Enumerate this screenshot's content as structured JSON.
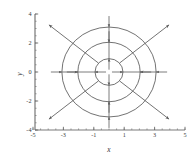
{
  "figure": {
    "title": "",
    "background_color": "#ffffff",
    "line_color": "#5a5a5a",
    "axis_color": "#6b6b6b",
    "text_color": "#3a3a3a"
  },
  "axes": {
    "x_label": "x",
    "y_label": "y",
    "x_ticks": [
      "-5",
      "-3",
      "-1",
      "1",
      "3",
      "5"
    ],
    "x_tick_values": [
      -5,
      -3,
      -1,
      1,
      3,
      5
    ],
    "y_ticks": [
      "-4",
      "-2",
      "0",
      "2",
      "4"
    ],
    "y_tick_values": [
      -4,
      -2,
      0,
      2,
      4
    ],
    "xlim": [
      -5,
      5
    ],
    "ylim": [
      -4,
      4
    ],
    "grid": false
  },
  "chart_data": {
    "type": "scatter",
    "title": "",
    "xlabel": "x",
    "ylabel": "y",
    "xlim": [
      -5,
      5
    ],
    "ylim": [
      -4,
      4
    ],
    "grid": false,
    "legend": null,
    "series": [
      {
        "name": "outer-orbit",
        "type": "circle",
        "center": [
          0,
          0
        ],
        "radius": 3.1
      },
      {
        "name": "middle-orbit",
        "type": "circle",
        "center": [
          0,
          0
        ],
        "radius": 2.05
      },
      {
        "name": "inner-orbit",
        "type": "circle",
        "center": [
          0,
          0
        ],
        "radius": 0.92
      }
    ],
    "rays": [
      {
        "name": "ray-upper-right",
        "x": [
          0.7,
          3.95
        ],
        "y": [
          0.62,
          3.25
        ],
        "arrow_at": "end"
      },
      {
        "name": "ray-upper-left",
        "x": [
          -0.7,
          -3.95
        ],
        "y": [
          0.62,
          3.25
        ],
        "arrow_at": "end"
      },
      {
        "name": "ray-lower-left",
        "x": [
          -0.7,
          -3.95
        ],
        "y": [
          -0.62,
          -3.25
        ],
        "arrow_at": "end"
      },
      {
        "name": "ray-lower-right",
        "x": [
          0.7,
          3.95
        ],
        "y": [
          -0.62,
          -3.25
        ],
        "arrow_at": "end"
      }
    ],
    "flow_arrows": [
      {
        "name": "arrow-outer-right",
        "x": 3.1,
        "y": 0,
        "direction": "left"
      },
      {
        "name": "arrow-outer-left",
        "x": -3.1,
        "y": 0,
        "direction": "right"
      },
      {
        "name": "arrow-outer-top",
        "x": 0,
        "y": 3.1,
        "direction": "down"
      },
      {
        "name": "arrow-outer-bottom",
        "x": 0,
        "y": -3.1,
        "direction": "up"
      },
      {
        "name": "arrow-middle-right",
        "x": 2.05,
        "y": 0,
        "direction": "left"
      },
      {
        "name": "arrow-middle-left",
        "x": -2.05,
        "y": 0,
        "direction": "right"
      },
      {
        "name": "arrow-middle-top",
        "x": 0,
        "y": 2.05,
        "direction": "down"
      },
      {
        "name": "arrow-middle-bottom",
        "x": 0,
        "y": -2.05,
        "direction": "up"
      },
      {
        "name": "arrow-inner-right",
        "x": 0.92,
        "y": 0,
        "direction": "right"
      },
      {
        "name": "arrow-inner-left",
        "x": -0.92,
        "y": 0,
        "direction": "left"
      },
      {
        "name": "arrow-inner-top",
        "x": 0,
        "y": 0.92,
        "direction": "up"
      },
      {
        "name": "arrow-inner-bottom",
        "x": 0,
        "y": -0.92,
        "direction": "down"
      }
    ]
  }
}
